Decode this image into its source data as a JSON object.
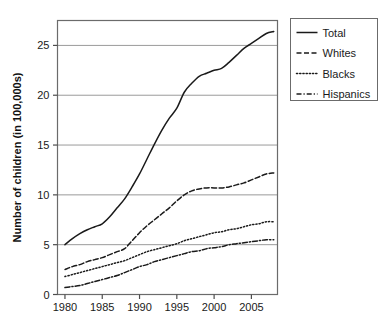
{
  "chart_data": {
    "type": "line",
    "title": "",
    "xlabel": "",
    "ylabel": "Number of children (in 100,000s)",
    "xlim": [
      1979,
      2008.5
    ],
    "ylim": [
      0,
      27.5
    ],
    "xticks": [
      1980,
      1985,
      1990,
      1995,
      2000,
      2005
    ],
    "xtick_labels": [
      "1980",
      "1985",
      "1990",
      "1995",
      "2000",
      "2005"
    ],
    "yticks": [
      0,
      5,
      10,
      15,
      20,
      25
    ],
    "ytick_labels": [
      "0",
      "5",
      "10",
      "15",
      "20",
      "25"
    ],
    "grid": "horizontal",
    "legend_position": "right-top",
    "x": [
      1980,
      1981,
      1982,
      1983,
      1984,
      1985,
      1986,
      1987,
      1988,
      1989,
      1990,
      1991,
      1992,
      1993,
      1994,
      1995,
      1996,
      1997,
      1998,
      1999,
      2000,
      2001,
      2002,
      2003,
      2004,
      2005,
      2006,
      2007,
      2008
    ],
    "series": [
      {
        "name": "Total",
        "style": "solid",
        "values": [
          5.0,
          5.6,
          6.1,
          6.5,
          6.8,
          7.1,
          7.8,
          8.7,
          9.6,
          10.8,
          12.1,
          13.6,
          15.1,
          16.5,
          17.7,
          18.7,
          20.3,
          21.2,
          21.9,
          22.2,
          22.5,
          22.7,
          23.3,
          24.0,
          24.7,
          25.2,
          25.7,
          26.2,
          26.4
        ]
      },
      {
        "name": "Whites",
        "style": "dashed",
        "values": [
          2.5,
          2.8,
          3.0,
          3.3,
          3.5,
          3.7,
          4.0,
          4.3,
          4.6,
          5.4,
          6.2,
          6.9,
          7.5,
          8.1,
          8.7,
          9.4,
          10.0,
          10.4,
          10.6,
          10.7,
          10.7,
          10.7,
          10.8,
          11.0,
          11.2,
          11.5,
          11.8,
          12.1,
          12.2
        ]
      },
      {
        "name": "Blacks",
        "style": "dotted",
        "values": [
          1.8,
          2.0,
          2.2,
          2.4,
          2.6,
          2.8,
          3.0,
          3.2,
          3.4,
          3.7,
          4.0,
          4.3,
          4.5,
          4.7,
          4.9,
          5.1,
          5.4,
          5.6,
          5.8,
          6.0,
          6.2,
          6.3,
          6.5,
          6.6,
          6.8,
          7.0,
          7.1,
          7.3,
          7.3
        ]
      },
      {
        "name": "Hispanics",
        "style": "dashdot",
        "values": [
          0.7,
          0.8,
          0.9,
          1.1,
          1.3,
          1.5,
          1.7,
          1.9,
          2.2,
          2.5,
          2.8,
          3.0,
          3.3,
          3.5,
          3.7,
          3.9,
          4.1,
          4.3,
          4.4,
          4.6,
          4.7,
          4.8,
          5.0,
          5.1,
          5.2,
          5.3,
          5.4,
          5.5,
          5.5
        ]
      }
    ]
  },
  "legend": {
    "items": [
      {
        "label": "Total"
      },
      {
        "label": "Whites"
      },
      {
        "label": "Blacks"
      },
      {
        "label": "Hispanics"
      }
    ]
  }
}
